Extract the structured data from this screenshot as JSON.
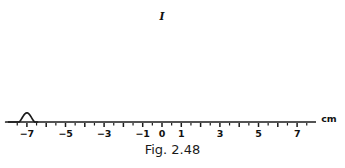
{
  "figure": {
    "caption": "Fig. 2.48",
    "intensity_symbol": "I",
    "unit_label": "cm"
  },
  "colors": {
    "curve": "#1a1a1a",
    "axis": "#1a1a1a",
    "text": "#111111",
    "background": "#ffffff"
  },
  "chart_data": {
    "type": "line",
    "title": "Fig. 2.48",
    "xlabel": "cm",
    "ylabel": "I",
    "grid": false,
    "legend": null,
    "xlim": [
      -8.2,
      8.2
    ],
    "ylim": [
      0,
      1.0
    ],
    "axis": {
      "origin_px_x": 162,
      "pixels_per_unit": 19.3,
      "baseline_px_y": 122,
      "minor_tick_step": 0.5,
      "major_tick_labels": [
        -7,
        -5,
        -3,
        -1,
        0,
        1,
        3,
        5,
        7
      ]
    },
    "tick_labels": [
      "−7",
      "−5",
      "−3",
      "−1",
      "0",
      "1",
      "3",
      "5",
      "7"
    ],
    "tick_values": [
      -7,
      -5,
      -3,
      -1,
      0,
      1,
      3,
      5,
      7
    ],
    "peaks": [
      {
        "center": -7.0,
        "height": 0.095,
        "halfwidth": 0.42
      },
      {
        "center": -6.0,
        "height": 0.125,
        "halfwidth": 0.45
      },
      {
        "center": -5.0,
        "height": 0.105,
        "halfwidth": 0.42
      },
      {
        "center": -3.0,
        "height": 0.15,
        "halfwidth": 0.46
      },
      {
        "center": -2.0,
        "height": 0.38,
        "halfwidth": 0.52
      },
      {
        "center": -1.0,
        "height": 0.62,
        "halfwidth": 0.52
      },
      {
        "center": 0.0,
        "height": 1.0,
        "halfwidth": 0.5
      },
      {
        "center": 1.0,
        "height": 0.62,
        "halfwidth": 0.52
      },
      {
        "center": 2.0,
        "height": 0.38,
        "halfwidth": 0.52
      },
      {
        "center": 3.0,
        "height": 0.25,
        "halfwidth": 0.52
      },
      {
        "center": 5.0,
        "height": 0.105,
        "halfwidth": 0.42
      },
      {
        "center": 6.0,
        "height": 0.125,
        "halfwidth": 0.45
      },
      {
        "center": 7.0,
        "height": 0.095,
        "halfwidth": 0.42
      }
    ],
    "peak_x": [
      -7,
      -6,
      -5,
      -3,
      -2,
      -1,
      0,
      1,
      2,
      3,
      5,
      6,
      7
    ],
    "peak_intensity": [
      0.095,
      0.125,
      0.105,
      0.15,
      0.38,
      0.62,
      1.0,
      0.62,
      0.38,
      0.25,
      0.105,
      0.125,
      0.095
    ],
    "missing_orders": [
      -4,
      4,
      -8,
      8
    ]
  }
}
